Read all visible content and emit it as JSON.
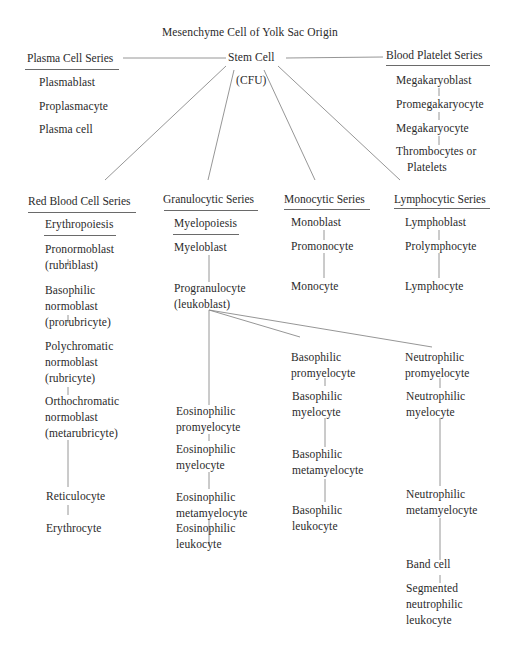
{
  "diagram": {
    "root": "Mesenchyme Cell of Yolk Sac Origin",
    "stem": {
      "label": "Stem Cell",
      "sublabel": "(CFU)"
    },
    "series": {
      "plasma": {
        "title": "Plasma Cell Series",
        "stages": [
          "Plasmablast",
          "Proplasmacyte",
          "Plasma cell"
        ]
      },
      "platelet": {
        "title": "Blood Platelet Series",
        "stages": [
          "Megakaryoblast",
          "Promegakaryocyte",
          "Megakaryocyte",
          "Thrombocytes or",
          "Platelets"
        ]
      },
      "red": {
        "title": "Red Blood Cell Series",
        "subtitle": "Erythropoiesis",
        "stages": [
          [
            "Pronormoblast",
            "(rubriblast)"
          ],
          [
            "Basophilic",
            "normoblast",
            "(prorubricyte)"
          ],
          [
            "Polychromatic",
            "normoblast",
            "(rubricyte)"
          ],
          [
            "Orthochromatic",
            "normoblast",
            "(metarubricyte)"
          ],
          [
            "Reticulocyte"
          ],
          [
            "Erythrocyte"
          ]
        ]
      },
      "granulocytic": {
        "title": "Granulocytic Series",
        "subtitle": "Myelopoiesis",
        "stages": [
          [
            "Myeloblast"
          ],
          [
            "Progranulocyte",
            "(leukoblast)"
          ]
        ],
        "branches": {
          "eosinophilic": [
            [
              "Eosinophilic",
              "promyelocyte"
            ],
            [
              "Eosinophilic",
              "myelocyte"
            ],
            [
              "Eosinophilic",
              "metamyelocyte"
            ],
            [
              "Eosinophilic",
              "leukocyte"
            ]
          ],
          "basophilic": [
            [
              "Basophilic",
              "promyelocyte"
            ],
            [
              "Basophilic",
              "myelocyte"
            ],
            [
              "Basophilic",
              "metamyelocyte"
            ],
            [
              "Basophilic",
              "leukocyte"
            ]
          ],
          "neutrophilic": [
            [
              "Neutrophilic",
              "promyelocyte"
            ],
            [
              "Neutrophilic",
              "myelocyte"
            ],
            [
              "Neutrophilic",
              "metamyelocyte"
            ],
            [
              "Band cell"
            ],
            [
              "Segmented",
              "neutrophilic",
              "leukocyte"
            ]
          ]
        }
      },
      "monocytic": {
        "title": "Monocytic Series",
        "stages": [
          "Monoblast",
          "Promonocyte",
          "Monocyte"
        ]
      },
      "lymphocytic": {
        "title": "Lymphocytic Series",
        "stages": [
          "Lymphoblast",
          "Prolymphocyte",
          "Lymphocyte"
        ]
      }
    }
  },
  "colors": {
    "text": "#2a2a2a",
    "line": "#8a8a8a",
    "background": "#ffffff"
  }
}
